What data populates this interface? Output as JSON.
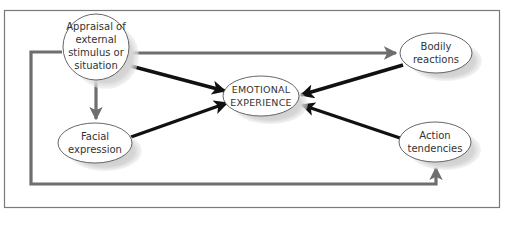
{
  "diagram": {
    "nodes": {
      "appraisal": {
        "lines": [
          "Appraisal of",
          "external",
          "stimulus or",
          "situation"
        ]
      },
      "emotional": {
        "lines": [
          "EMOTIONAL",
          "EXPERIENCE"
        ]
      },
      "facial": {
        "lines": [
          "Facial",
          "expression"
        ]
      },
      "bodily": {
        "lines": [
          "Bodily",
          "reactions"
        ]
      },
      "action": {
        "lines": [
          "Action",
          "tendencies"
        ]
      }
    },
    "edges": [
      {
        "from": "appraisal",
        "to": "emotional",
        "style": "black"
      },
      {
        "from": "appraisal",
        "to": "facial",
        "style": "gray"
      },
      {
        "from": "appraisal",
        "to": "bodily",
        "style": "gray"
      },
      {
        "from": "appraisal",
        "to": "action",
        "style": "gray"
      },
      {
        "from": "facial",
        "to": "emotional",
        "style": "black"
      },
      {
        "from": "bodily",
        "to": "emotional",
        "style": "black"
      },
      {
        "from": "action",
        "to": "emotional",
        "style": "black"
      }
    ],
    "colors": {
      "frame": "#777777",
      "gray_arrow": "#6e6e6e",
      "black_arrow": "#111111",
      "shadow": "#c8c8c8"
    }
  }
}
